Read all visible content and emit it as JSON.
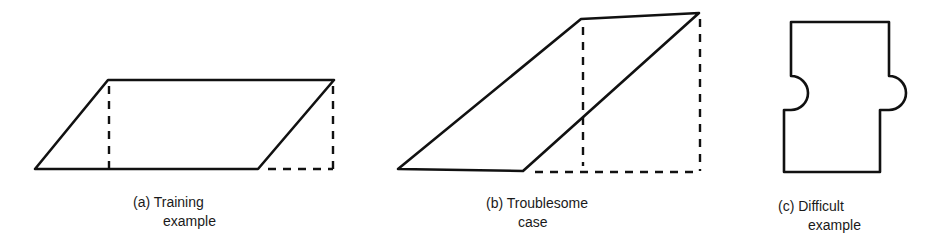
{
  "figure": {
    "panels": [
      {
        "id": "a",
        "caption_line1": "(a) Training",
        "caption_line2": "example",
        "shape": "parallelogram with dashed perpendicular projections"
      },
      {
        "id": "b",
        "caption_line1": "(b) Troublesome",
        "caption_line2": "case",
        "shape": "steep parallelogram with dashed perpendicular projections"
      },
      {
        "id": "c",
        "caption_line1": "(c) Difficult",
        "caption_line2": "example",
        "shape": "puzzle-piece shape with two semicircular bumps"
      }
    ],
    "colors": {
      "line": "#111111",
      "background": "#ffffff"
    }
  }
}
